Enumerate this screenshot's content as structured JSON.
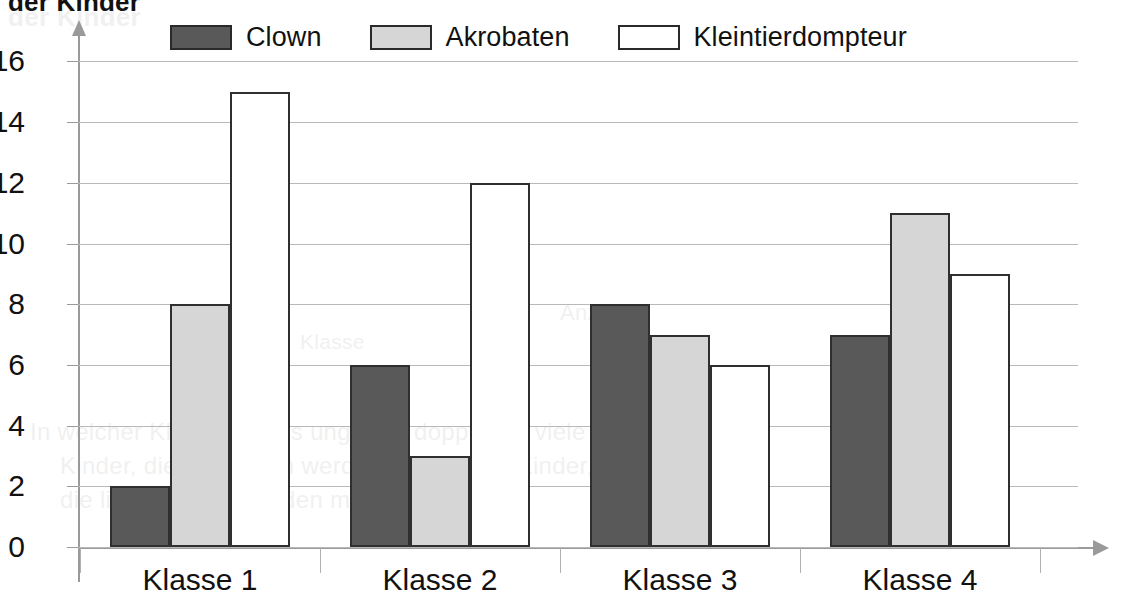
{
  "title_fragment": "der Kinder",
  "legend": {
    "items": [
      {
        "label": "Clown",
        "color": "#595959",
        "swatch": "clown-swatch"
      },
      {
        "label": "Akrobaten",
        "color": "#d6d6d6",
        "swatch": "akrobaten-swatch"
      },
      {
        "label": "Kleintierdompteur",
        "color": "#ffffff",
        "swatch": "kleintierdompteur-swatch"
      }
    ]
  },
  "ghost_text": [
    {
      "text": "der Kinder",
      "x": 8,
      "y": 2,
      "size": 26,
      "bold": true
    },
    {
      "text": "Anzahl",
      "x": 560,
      "y": 300,
      "size": 22,
      "bold": false
    },
    {
      "text": "In welcher Klasse gibt es ungefähr doppelt so viele",
      "x": 30,
      "y": 418,
      "size": 24,
      "bold": false
    },
    {
      "text": "Kinder, die Akrobaten werden wollen, wie Kinder,",
      "x": 60,
      "y": 452,
      "size": 24,
      "bold": false
    },
    {
      "text": "die lieber Clown werden möchten?",
      "x": 60,
      "y": 486,
      "size": 24,
      "bold": false
    },
    {
      "text": "Klasse",
      "x": 300,
      "y": 330,
      "size": 21,
      "bold": false
    }
  ],
  "chart_data": {
    "type": "bar",
    "title": "der Kinder",
    "xlabel": "",
    "ylabel": "",
    "categories": [
      "Klasse 1",
      "Klasse 2",
      "Klasse 3",
      "Klasse 4"
    ],
    "series": [
      {
        "name": "Clown",
        "color": "#595959",
        "values": [
          2,
          6,
          8,
          7
        ]
      },
      {
        "name": "Akrobaten",
        "color": "#d6d6d6",
        "values": [
          8,
          3,
          7,
          11
        ]
      },
      {
        "name": "Kleintierdompteur",
        "color": "#ffffff",
        "values": [
          15,
          12,
          6,
          9
        ]
      }
    ],
    "yticks": [
      0,
      2,
      4,
      6,
      8,
      10,
      12,
      14,
      16
    ],
    "ylim": [
      0,
      17.3
    ],
    "grid": true,
    "legend_position": "top"
  }
}
